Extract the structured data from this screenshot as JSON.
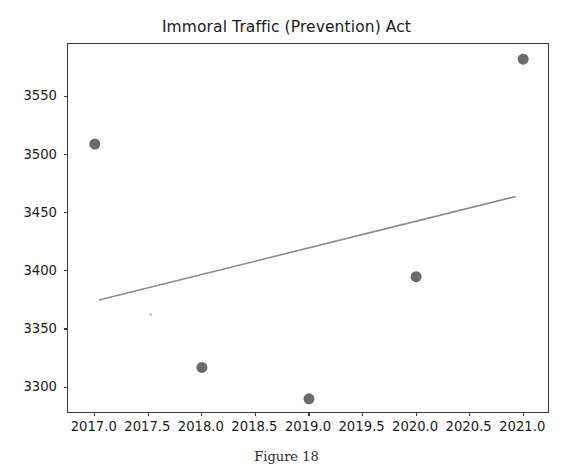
{
  "figure": {
    "caption": "Figure 18",
    "background_color": "#ffffff"
  },
  "chart_data": {
    "type": "scatter",
    "title": "Immoral Traffic (Prevention) Act",
    "xlabel": "",
    "ylabel": "",
    "x": [
      2017,
      2018,
      2019,
      2020,
      2021
    ],
    "values": [
      3509,
      3317,
      3290,
      3395,
      3582
    ],
    "series": [
      {
        "name": "cases",
        "type": "scatter",
        "marker": "circle",
        "color": "#6b6b6b",
        "marker_size": 11,
        "points": [
          {
            "x": 2017,
            "y": 3509
          },
          {
            "x": 2018,
            "y": 3317
          },
          {
            "x": 2019,
            "y": 3290
          },
          {
            "x": 2020,
            "y": 3395
          },
          {
            "x": 2021,
            "y": 3582
          }
        ]
      },
      {
        "name": "trendline",
        "type": "line",
        "color": "#8a8a8a",
        "line_width": 1.6,
        "points": [
          {
            "x": 2017.04,
            "y": 3375
          },
          {
            "x": 2020.93,
            "y": 3464
          }
        ]
      }
    ],
    "xlim": [
      2016.75,
      2021.25
    ],
    "ylim": [
      3277,
      3595
    ],
    "xticks": [
      2017.0,
      2017.5,
      2018.0,
      2018.5,
      2019.0,
      2019.5,
      2020.0,
      2020.5,
      2021.0
    ],
    "xtick_labels": [
      "2017.0",
      "2017.5",
      "2018.0",
      "2018.5",
      "2019.0",
      "2019.5",
      "2020.0",
      "2020.5",
      "2021.0"
    ],
    "yticks": [
      3300,
      3350,
      3400,
      3450,
      3500,
      3550
    ],
    "ytick_labels": [
      "3300",
      "3350",
      "3400",
      "3450",
      "3500",
      "3550"
    ],
    "grid": false,
    "legend": null,
    "legend_position": "none",
    "annotations": []
  },
  "axes": {
    "spine_color": "#3a3a3a",
    "tick_color": "#3a3a3a",
    "label_color": "#1a1a1a"
  }
}
